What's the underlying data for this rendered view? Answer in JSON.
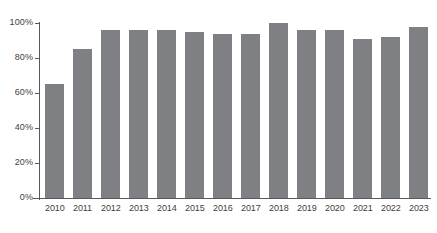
{
  "chart_data": {
    "type": "bar",
    "title": "",
    "subtitle": "",
    "xlabel": "",
    "ylabel": "",
    "categories": [
      "2010",
      "2011",
      "2012",
      "2013",
      "2014",
      "2015",
      "2016",
      "2017",
      "2018",
      "2019",
      "2020",
      "2021",
      "2022",
      "2023"
    ],
    "values": [
      65,
      85,
      96,
      96,
      96,
      95,
      94,
      94,
      100,
      96,
      96,
      91,
      92,
      98
    ],
    "ylim": [
      0,
      100
    ],
    "y_ticks": [
      0,
      20,
      40,
      60,
      80,
      100
    ],
    "y_tick_labels": [
      "0%",
      "20%",
      "40%",
      "60%",
      "80%",
      "100%"
    ],
    "grid": false,
    "legend": null,
    "legend_position": "none",
    "annotations": [],
    "value_suffix": "%",
    "bar_color": "#7f8083",
    "axis_color": "#58595b",
    "label_color": "#3f4042",
    "background_color": "#ffffff"
  }
}
